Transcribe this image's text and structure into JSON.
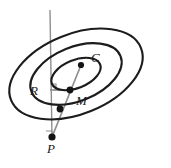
{
  "figure": {
    "name": "concentric-ellipses-geometry-diagram",
    "background": "#ffffff",
    "width": 171,
    "height": 168,
    "colors": {
      "curve_stroke": "#1c1c1c",
      "construction_line": "#8f8f8f",
      "point_fill": "#141414",
      "label_color": "#1a1a1a"
    },
    "labels": {
      "center": "C",
      "midpoint": "M",
      "radius": "R",
      "point": "P"
    },
    "ellipses": [
      {
        "name": "outer-ellipse",
        "cx": 76,
        "cy": 74,
        "rx": 70,
        "ry": 40,
        "rotation": -22
      },
      {
        "name": "middle-ellipse",
        "cx": 76,
        "cy": 74,
        "rx": 48,
        "ry": 27,
        "rotation": -22
      },
      {
        "name": "inner-ellipse",
        "cx": 76,
        "cy": 74,
        "rx": 26,
        "ry": 14,
        "rotation": -22
      }
    ],
    "points": [
      {
        "name": "point-c",
        "label": "C",
        "x": 81,
        "y": 65,
        "label_x": 91,
        "label_y": 62
      },
      {
        "name": "point-m",
        "label": "M",
        "x": 70,
        "y": 90,
        "label_x": 76,
        "label_y": 105
      },
      {
        "name": "point-q",
        "label": "",
        "x": 60,
        "y": 109,
        "label_x": 0,
        "label_y": 0
      },
      {
        "name": "point-p",
        "label": "P",
        "x": 52,
        "y": 137,
        "label_x": 47,
        "label_y": 152
      }
    ],
    "segments": [
      {
        "name": "vertical-axis-line",
        "x1": 50,
        "y1": 10,
        "x2": 52,
        "y2": 139
      },
      {
        "name": "ray-p-to-c",
        "x1": 52,
        "y1": 137,
        "x2": 81,
        "y2": 65
      },
      {
        "name": "radius-segment-r",
        "x1": 50,
        "y1": 90,
        "x2": 70,
        "y2": 90
      }
    ],
    "right_angle_marks": [
      {
        "name": "right-angle-at-r",
        "x": 50,
        "y": 84,
        "size": 6
      },
      {
        "name": "right-angle-at-p",
        "x": 46,
        "y": 131,
        "size": 6
      }
    ]
  }
}
